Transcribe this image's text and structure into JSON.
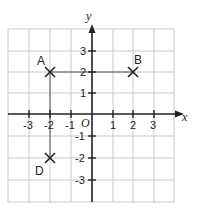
{
  "diagram": {
    "type": "coordinate-grid",
    "axes": {
      "x_label": "x",
      "y_label": "y",
      "origin_label": "O",
      "x_ticks": [
        "-3",
        "-2",
        "-1",
        "1",
        "2",
        "3"
      ],
      "y_ticks": [
        "3",
        "2",
        "1",
        "-1",
        "-2",
        "-3"
      ],
      "range": {
        "x": [
          -4,
          4
        ],
        "y": [
          -4,
          4
        ]
      }
    },
    "points": [
      {
        "label": "A",
        "x": -2,
        "y": 2
      },
      {
        "label": "B",
        "x": 2,
        "y": 2
      },
      {
        "label": "D",
        "x": -2,
        "y": -2
      }
    ],
    "segments": [
      {
        "from": "A",
        "to": "B"
      },
      {
        "from": "A",
        "to": "D"
      }
    ],
    "colors": {
      "grid": "#c8c8c8",
      "axis": "#222222",
      "marker": "#222222"
    }
  }
}
